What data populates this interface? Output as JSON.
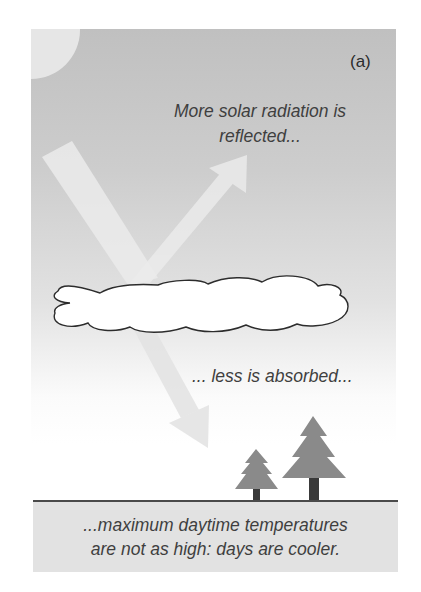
{
  "figure": {
    "panel_label": "(a)",
    "reflected_caption": [
      "More solar radiation is",
      "reflected..."
    ],
    "absorbed_caption": "... less is absorbed...",
    "ground_caption": [
      "...maximum daytime temperatures",
      "are not as high: days are cooler."
    ]
  },
  "elements": {
    "sun": "sun-icon",
    "cloud": "cloud-icon",
    "incoming_beam": "incoming-radiation-arrow",
    "reflected_beam": "reflected-radiation-arrow",
    "transmitted_beam": "transmitted-radiation-arrow",
    "trees": [
      "small-tree-icon",
      "large-tree-icon"
    ]
  },
  "colors": {
    "sky_top": "#c0c0c0",
    "sky_bottom": "#ffffff",
    "sun": "#e6e6e6",
    "beam": "#ececec",
    "tree": "#8a8a8a",
    "trunk": "#3a3a3a",
    "ground": "#e2e2e2",
    "ground_line": "#4a4a4a",
    "text": "#3f3f3f"
  }
}
